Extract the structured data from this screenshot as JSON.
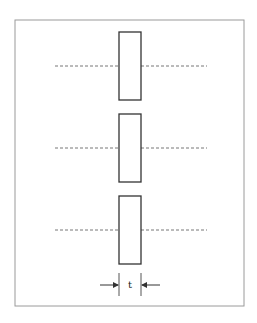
{
  "diagram": {
    "frame": {
      "x": 15,
      "y": 20,
      "width": 229,
      "height": 286,
      "stroke": "#9a9a9a"
    },
    "plates": [
      {
        "x": 119,
        "y": 32,
        "width": 22,
        "height": 68,
        "centerline_y": 66
      },
      {
        "x": 119,
        "y": 114,
        "width": 22,
        "height": 68,
        "centerline_y": 148
      },
      {
        "x": 119,
        "y": 196,
        "width": 22,
        "height": 68,
        "centerline_y": 230
      }
    ],
    "centerline": {
      "left_start_x": 55,
      "right_end_x": 207,
      "stroke": "#777777"
    },
    "plate_stroke": "#333333",
    "dimension": {
      "label": "t",
      "left_x": 119,
      "right_x": 141,
      "y": 285,
      "tick_top": 273,
      "tick_bottom": 296,
      "arrow_left_start": 100,
      "arrow_right_start": 160
    }
  }
}
